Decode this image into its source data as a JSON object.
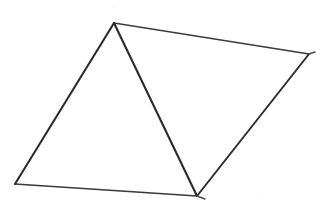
{
  "canvas": {
    "width": 327,
    "height": 214,
    "background_color": "#ffffff",
    "description": "Hand-drawn line figure: a quadrilateral divided by one interior diagonal into two triangles"
  },
  "figure": {
    "title": "Quadrilateral with interior diagonal",
    "shape_type": "quadrilateral-with-diagonal",
    "fill": "none",
    "vertices": [
      {
        "id": "apex",
        "label": "top apex vertex",
        "x": 114,
        "y": 23
      },
      {
        "id": "right",
        "label": "right vertex",
        "x": 309,
        "y": 54
      },
      {
        "id": "bottom",
        "label": "bottom vertex",
        "x": 197,
        "y": 196
      },
      {
        "id": "left",
        "label": "bottom-left vertex",
        "x": 15,
        "y": 184
      }
    ],
    "edges": [
      {
        "id": "edge-top-right",
        "label": "top-right edge (apex to right vertex)",
        "from": "apex",
        "to": "right",
        "color": "#3b3b3f",
        "stroke_width": 1.6
      },
      {
        "id": "edge-right-lower",
        "label": "lower-right edge (right vertex to bottom vertex)",
        "from": "right",
        "to": "bottom",
        "color": "#2f2f33",
        "stroke_width": 2.0
      },
      {
        "id": "edge-bottom",
        "label": "bottom edge (bottom vertex to bottom-left vertex)",
        "from": "bottom",
        "to": "left",
        "color": "#39393d",
        "stroke_width": 1.7
      },
      {
        "id": "edge-left",
        "label": "left edge (bottom-left vertex to apex)",
        "from": "left",
        "to": "apex",
        "color": "#2b2b2f",
        "stroke_width": 2.1
      },
      {
        "id": "edge-diagonal",
        "label": "interior diagonal (apex to bottom vertex)",
        "from": "apex",
        "to": "bottom",
        "color": "#2b2b2f",
        "stroke_width": 2.1,
        "interior": true
      }
    ],
    "overshoot_ticks": [
      {
        "id": "tick-right-vertex",
        "label": "pen overshoot past right vertex",
        "x1": 309,
        "y1": 54,
        "x2": 315,
        "y2": 52,
        "color": "#4a4a4e",
        "stroke_width": 1.4
      },
      {
        "id": "tick-bottom-vertex",
        "label": "pen overshoot past bottom vertex",
        "x1": 197,
        "y1": 196,
        "x2": 205,
        "y2": 199,
        "color": "#4a4a4e",
        "stroke_width": 1.4
      }
    ],
    "regions": [
      {
        "id": "region-left-triangle",
        "label": "left triangle (apex, bottom-left, bottom)",
        "vertex_ids": [
          "apex",
          "left",
          "bottom"
        ]
      },
      {
        "id": "region-right-triangle",
        "label": "right triangle (apex, right, bottom)",
        "vertex_ids": [
          "apex",
          "right",
          "bottom"
        ]
      }
    ],
    "scan_specks": [
      {
        "x": 258,
        "y": 196,
        "width": 3,
        "height": 3
      },
      {
        "x": 112,
        "y": 6,
        "width": 4,
        "height": 3
      },
      {
        "x": 300,
        "y": 14,
        "width": 2,
        "height": 2
      },
      {
        "x": 44,
        "y": 60,
        "width": 2,
        "height": 2
      },
      {
        "x": 178,
        "y": 148,
        "width": 2,
        "height": 2
      }
    ]
  }
}
